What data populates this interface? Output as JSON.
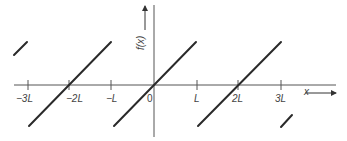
{
  "diagram": {
    "x_axis": {
      "label": "x",
      "arrow": "right"
    },
    "y_axis": {
      "label": "f(x)",
      "arrow": "up"
    },
    "ticks": [
      {
        "label": "−3L",
        "value": -3
      },
      {
        "label": "−2L",
        "value": -2
      },
      {
        "label": "−L",
        "value": -1
      },
      {
        "label": "0",
        "value": 0
      },
      {
        "label": "L",
        "value": 1
      },
      {
        "label": "2L",
        "value": 2
      },
      {
        "label": "3L",
        "value": 3
      }
    ],
    "period": "2L",
    "segments": [
      {
        "name": "partial-left",
        "from_x": "-3.35L",
        "to_x": "-3L"
      },
      {
        "name": "tooth-centered-minus-2L",
        "from_x": "-3L",
        "to_x": "-L"
      },
      {
        "name": "tooth-centered-0",
        "from_x": "-L",
        "to_x": "L"
      },
      {
        "name": "tooth-centered-2L",
        "from_x": "L",
        "to_x": "3L"
      },
      {
        "name": "partial-right",
        "from_x": "3L",
        "to_x": "3.3L"
      }
    ],
    "colors": {
      "line": "#2a2a2a",
      "axis": "#555555",
      "text": "#444444"
    }
  }
}
